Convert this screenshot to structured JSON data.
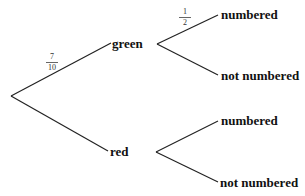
{
  "diagram": {
    "type": "probability-tree",
    "root": {
      "branches": [
        {
          "label": "green",
          "probability": {
            "numerator": "7",
            "denominator": "10"
          },
          "branches": [
            {
              "label": "numbered",
              "probability": {
                "numerator": "1",
                "denominator": "2"
              }
            },
            {
              "label": "not numbered"
            }
          ]
        },
        {
          "label": "red",
          "branches": [
            {
              "label": "numbered"
            },
            {
              "label": "not numbered"
            }
          ]
        }
      ]
    },
    "colors": {
      "line": "#222222",
      "text": "#111111"
    }
  }
}
